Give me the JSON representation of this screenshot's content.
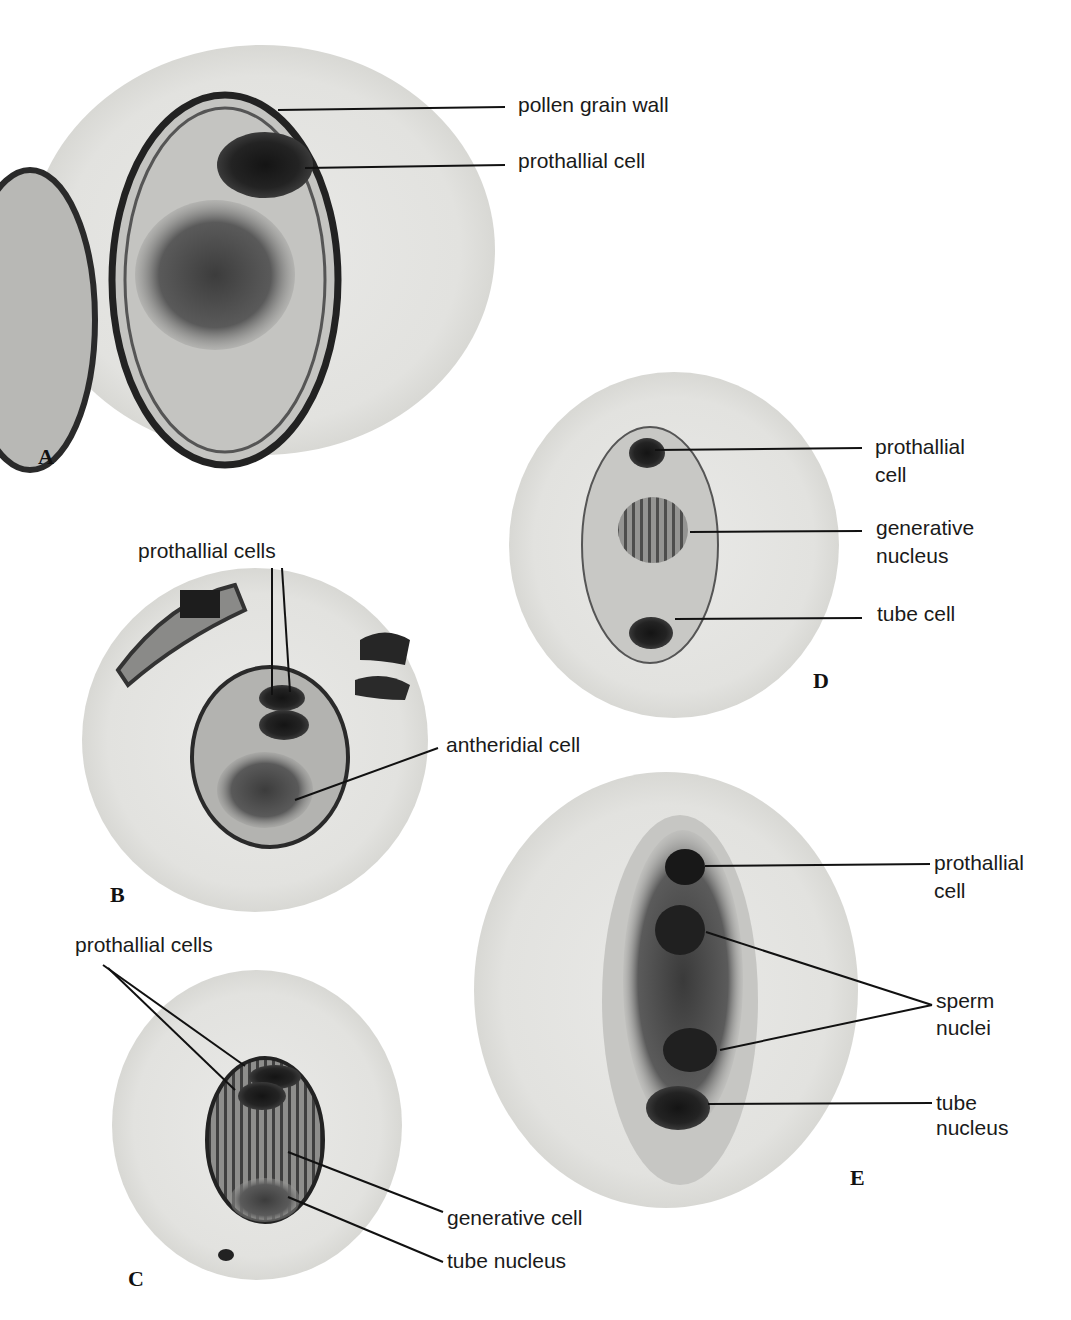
{
  "figure": {
    "panels": [
      {
        "letter": "A",
        "labels": [
          "pollen grain wall",
          "prothallial cell"
        ]
      },
      {
        "letter": "B",
        "labels": [
          "prothallial cells",
          "antheridial cell"
        ]
      },
      {
        "letter": "C",
        "labels": [
          "prothallial cells",
          "generative cell",
          "tube nucleus"
        ]
      },
      {
        "letter": "D",
        "labels": [
          "prothallial",
          "cell",
          "generative",
          "nucleus",
          "tube cell"
        ]
      },
      {
        "letter": "E",
        "labels": [
          "prothallial",
          "cell",
          "sperm",
          "nuclei",
          "tube",
          "nucleus"
        ]
      }
    ]
  }
}
